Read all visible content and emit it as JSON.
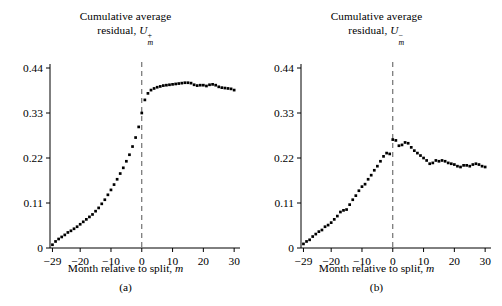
{
  "figure": {
    "background": "#ffffff",
    "point_color": "#000000",
    "axis_color": "#000000",
    "dashed_line_color": "#555555"
  },
  "panels": [
    {
      "key": "a",
      "subcaption": "(a)",
      "title_line1": "Cumulative average",
      "title_line2_prefix": "residual, ",
      "title_symbol": "U",
      "title_sup": "+",
      "title_sub": "m",
      "xlabel_prefix": "Month relative to split, ",
      "xlabel_symbol": "m",
      "yticks": [
        "0.44",
        "0.33",
        "0.22",
        "0.11",
        "0"
      ],
      "ytickvalues": [
        0.44,
        0.33,
        0.22,
        0.11,
        0
      ],
      "xticks": [
        "−29",
        "−20",
        "−10",
        "0",
        "10",
        "20",
        "30"
      ],
      "xtickvalues": [
        -29,
        -20,
        -10,
        0,
        10,
        20,
        30
      ],
      "vline_at": 0
    },
    {
      "key": "b",
      "subcaption": "(b)",
      "title_line1": "Cumulative average",
      "title_line2_prefix": "residual, ",
      "title_symbol": "U",
      "title_sup": "−",
      "title_sub": "m",
      "xlabel_prefix": "Month relative to split, ",
      "xlabel_symbol": "m",
      "yticks": [
        "0.44",
        "0.33",
        "0.22",
        "0.11",
        "0"
      ],
      "ytickvalues": [
        0.44,
        0.33,
        0.22,
        0.11,
        0
      ],
      "xticks": [
        "−29",
        "−20",
        "−10",
        "0",
        "10",
        "20",
        "30"
      ],
      "xtickvalues": [
        -29,
        -20,
        -10,
        0,
        10,
        20,
        30
      ],
      "vline_at": 0
    }
  ],
  "chart_data": [
    {
      "type": "scatter",
      "panel": "a",
      "title": "Cumulative average residual, U+m",
      "xlabel": "Month relative to split, m",
      "ylabel": "Cumulative average residual, U+m",
      "xlim": [
        -30,
        31
      ],
      "ylim": [
        0,
        0.47
      ],
      "grid": false,
      "legend": null,
      "annotations": [
        {
          "type": "vline",
          "x": 0,
          "style": "dashed"
        }
      ],
      "x": [
        -29,
        -28,
        -27,
        -26,
        -25,
        -24,
        -23,
        -22,
        -21,
        -20,
        -19,
        -18,
        -17,
        -16,
        -15,
        -14,
        -13,
        -12,
        -11,
        -10,
        -9,
        -8,
        -7,
        -6,
        -5,
        -4,
        -3,
        -2,
        -1,
        0,
        1,
        2,
        3,
        4,
        5,
        6,
        7,
        8,
        9,
        10,
        11,
        12,
        13,
        14,
        15,
        16,
        17,
        18,
        19,
        20,
        21,
        22,
        23,
        24,
        25,
        26,
        27,
        28,
        29,
        30
      ],
      "y": [
        0.008,
        0.016,
        0.022,
        0.027,
        0.032,
        0.038,
        0.042,
        0.047,
        0.052,
        0.058,
        0.064,
        0.07,
        0.076,
        0.082,
        0.09,
        0.098,
        0.108,
        0.118,
        0.13,
        0.142,
        0.155,
        0.168,
        0.182,
        0.196,
        0.212,
        0.228,
        0.248,
        0.27,
        0.296,
        0.33,
        0.362,
        0.378,
        0.386,
        0.39,
        0.393,
        0.395,
        0.397,
        0.398,
        0.399,
        0.4,
        0.401,
        0.402,
        0.403,
        0.404,
        0.404,
        0.403,
        0.399,
        0.397,
        0.398,
        0.398,
        0.396,
        0.399,
        0.4,
        0.398,
        0.394,
        0.392,
        0.391,
        0.39,
        0.389,
        0.386
      ]
    },
    {
      "type": "scatter",
      "panel": "b",
      "title": "Cumulative average residual, U−m",
      "xlabel": "Month relative to split, m",
      "ylabel": "Cumulative average residual, U−m",
      "xlim": [
        -30,
        31
      ],
      "ylim": [
        0,
        0.47
      ],
      "grid": false,
      "legend": null,
      "annotations": [
        {
          "type": "vline",
          "x": 0,
          "style": "dashed"
        }
      ],
      "x": [
        -29,
        -28,
        -27,
        -26,
        -25,
        -24,
        -23,
        -22,
        -21,
        -20,
        -19,
        -18,
        -17,
        -16,
        -15,
        -14,
        -13,
        -12,
        -11,
        -10,
        -9,
        -8,
        -7,
        -6,
        -5,
        -4,
        -3,
        -2,
        -1,
        0,
        1,
        2,
        3,
        4,
        5,
        6,
        7,
        8,
        9,
        10,
        11,
        12,
        13,
        14,
        15,
        16,
        17,
        18,
        19,
        20,
        21,
        22,
        23,
        24,
        25,
        26,
        27,
        28,
        29,
        30
      ],
      "y": [
        0.01,
        0.016,
        0.02,
        0.028,
        0.034,
        0.04,
        0.044,
        0.052,
        0.056,
        0.062,
        0.07,
        0.078,
        0.088,
        0.092,
        0.094,
        0.106,
        0.118,
        0.128,
        0.14,
        0.15,
        0.156,
        0.168,
        0.178,
        0.19,
        0.2,
        0.212,
        0.224,
        0.232,
        0.23,
        0.265,
        0.263,
        0.25,
        0.252,
        0.258,
        0.256,
        0.246,
        0.238,
        0.232,
        0.226,
        0.22,
        0.214,
        0.206,
        0.208,
        0.214,
        0.212,
        0.214,
        0.212,
        0.208,
        0.206,
        0.204,
        0.2,
        0.198,
        0.202,
        0.202,
        0.2,
        0.204,
        0.206,
        0.204,
        0.2,
        0.198
      ]
    }
  ]
}
